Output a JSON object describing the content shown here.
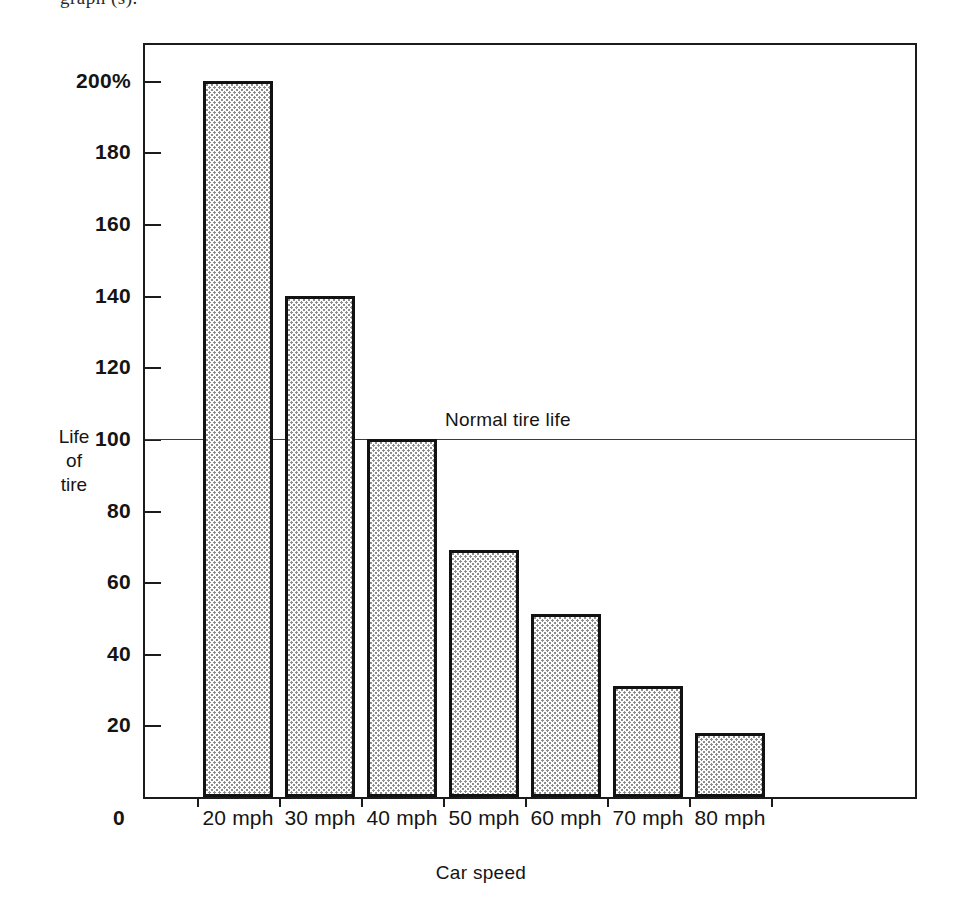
{
  "figure": {
    "caption_fragment": "graph (s)."
  },
  "chart_data": {
    "type": "bar",
    "title": "",
    "xlabel": "Car speed",
    "ylabel": "Life of tire",
    "ylabel_lines": [
      "Life",
      "of",
      "tire"
    ],
    "categories": [
      "20 mph",
      "30 mph",
      "40 mph",
      "50 mph",
      "60 mph",
      "70 mph",
      "80 mph"
    ],
    "values": [
      200,
      140,
      100,
      69,
      51,
      31,
      18
    ],
    "ylim": [
      0,
      210
    ],
    "ytick_values": [
      0,
      20,
      40,
      60,
      80,
      100,
      120,
      140,
      160,
      180,
      200
    ],
    "ytick_labels": [
      "0",
      "20",
      "40",
      "60",
      "80",
      "100",
      "120",
      "140",
      "160",
      "180",
      "200%"
    ],
    "grid": false,
    "legend": null,
    "annotations": [
      {
        "text": "Normal tire life",
        "y_value": 100,
        "style": "horizontal reference line across plot with label above at left-center"
      }
    ],
    "bar_style": {
      "fill": "dot-screen stipple",
      "fill_color": "#8e8e8e",
      "background_color": "#ffffff",
      "border_color": "#121212"
    },
    "frame_color": "#1b1b1b"
  }
}
